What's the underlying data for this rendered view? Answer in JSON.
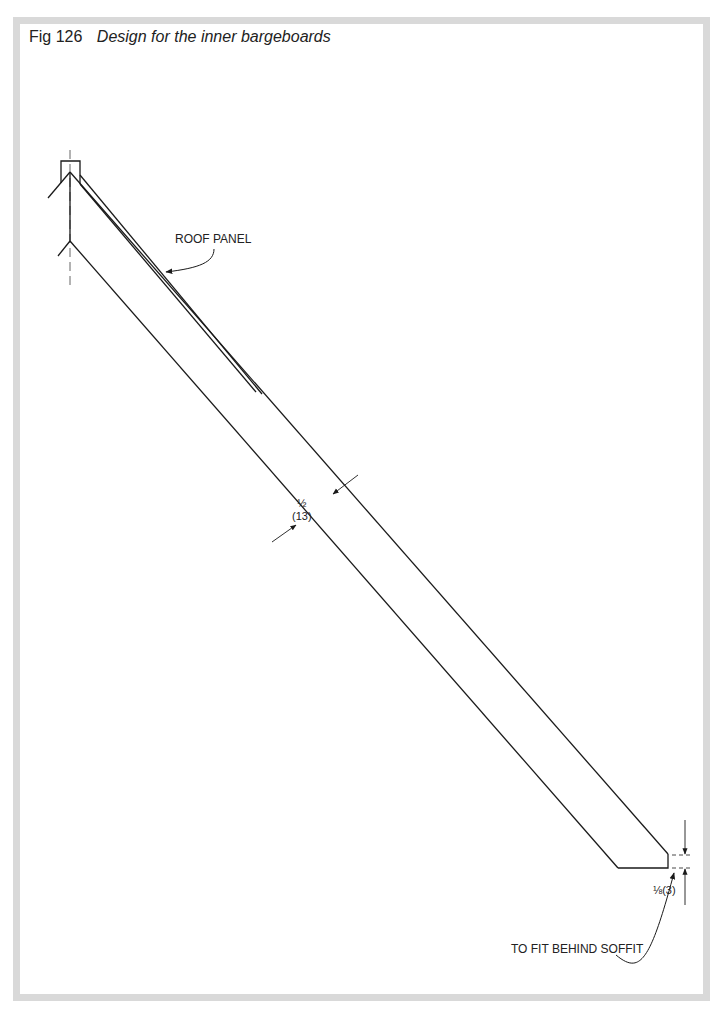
{
  "figure": {
    "number_label": "Fig 126",
    "caption": "Design for the inner bargeboards"
  },
  "annotations": {
    "roof_panel": "ROOF PANEL",
    "width_dim_fraction": "½",
    "width_dim_metric": "(13)",
    "end_dim": "⅛(3)",
    "soffit_note": "TO FIT BEHIND SOFFIT"
  },
  "colors": {
    "frame": "#d9d9d9",
    "ink": "#1a1a1a",
    "background": "#ffffff"
  }
}
